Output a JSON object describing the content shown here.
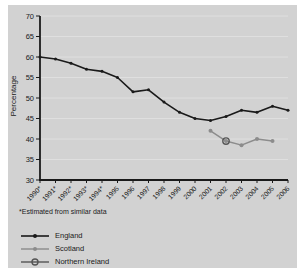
{
  "panel": {
    "background": "#d2d2d2"
  },
  "chart_data": {
    "type": "line",
    "title": "",
    "ylabel": "Percentage",
    "xlabel": "",
    "ylim": [
      30,
      70
    ],
    "ytick_step": 5,
    "grid": true,
    "legend_position": "bottom-left",
    "footnote": "*Estimated from similar data",
    "years": [
      1990,
      1991,
      1992,
      1993,
      1994,
      1995,
      1996,
      1997,
      1998,
      1999,
      2000,
      2001,
      2002,
      2003,
      2004,
      2005,
      2006
    ],
    "x_tick_labels": [
      "1990*",
      "1991*",
      "1992*",
      "1993*",
      "1994*",
      "1995",
      "1996",
      "1997",
      "1998",
      "1999",
      "2000",
      "2001",
      "2002",
      "2003",
      "2004",
      "2005",
      "2006"
    ],
    "series": [
      {
        "id": "england",
        "name": "England",
        "color": "#1a1a1a",
        "marker": "dot",
        "marker_r": 1.5,
        "line_width": 1.6,
        "x": [
          1990,
          1991,
          1992,
          1993,
          1994,
          1995,
          1996,
          1997,
          1998,
          1999,
          2000,
          2001,
          2002,
          2003,
          2004,
          2005,
          2006
        ],
        "values": [
          60,
          59.5,
          58.5,
          57,
          56.5,
          55,
          51.5,
          52,
          49,
          46.5,
          45,
          44.5,
          45.5,
          47,
          46.5,
          48,
          47
        ]
      },
      {
        "id": "scotland",
        "name": "Scotland",
        "color": "#8c8c8c",
        "marker": "dot",
        "marker_r": 2,
        "line_width": 1.4,
        "x": [
          2001,
          2002,
          2003,
          2004,
          2005
        ],
        "values": [
          42,
          39.5,
          38.5,
          40,
          39.5
        ]
      },
      {
        "id": "northern-ireland",
        "name": "Northern Ireland",
        "color": "#555555",
        "marker": "ring",
        "line_width": 1.4,
        "x": [
          2002
        ],
        "values": [
          39.5
        ]
      }
    ]
  }
}
